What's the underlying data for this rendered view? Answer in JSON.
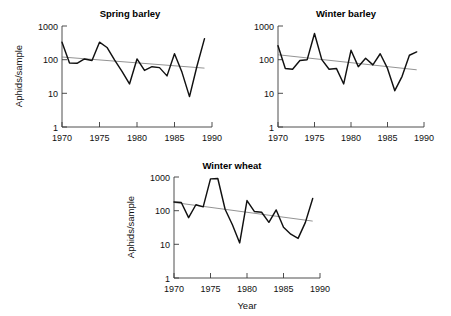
{
  "figure": {
    "background": "#ffffff",
    "series_color": "#111111",
    "trend_color": "#6f6f6f",
    "axis_color": "#3a3a3a",
    "xlabel": "Year",
    "ylabel": "Aphids/sample"
  },
  "chart_data": [
    {
      "type": "line",
      "title": "Spring barley",
      "xlabel": "",
      "ylabel": "Aphids/sample",
      "yscale": "log",
      "ylim": [
        1,
        1000
      ],
      "ytick_labels": [
        "1",
        "10",
        "100",
        "1000"
      ],
      "ytick_values": [
        1,
        10,
        100,
        1000
      ],
      "xlim": [
        1970,
        1990
      ],
      "xtick_labels": [
        "1970",
        "1975",
        "1980",
        "1985",
        "1990"
      ],
      "xtick_values": [
        1970,
        1975,
        1980,
        1985,
        1990
      ],
      "grid": false,
      "legend": "none",
      "x": [
        1970,
        1971,
        1972,
        1973,
        1974,
        1975,
        1976,
        1977,
        1978,
        1979,
        1980,
        1981,
        1982,
        1983,
        1984,
        1985,
        1986,
        1987,
        1988,
        1989
      ],
      "series": [
        {
          "name": "Aphids/sample",
          "values": [
            330,
            80,
            78,
            105,
            95,
            330,
            230,
            98,
            45,
            19,
            105,
            48,
            62,
            58,
            33,
            150,
            42,
            8,
            65,
            420
          ]
        },
        {
          "name": "trend",
          "values": [
            120,
            116,
            111,
            107,
            103,
            99,
            95,
            91,
            88,
            84,
            81,
            78,
            75,
            72,
            69,
            66,
            64,
            61,
            59,
            56
          ]
        }
      ]
    },
    {
      "type": "line",
      "title": "Winter barley",
      "xlabel": "",
      "ylabel": "",
      "yscale": "log",
      "ylim": [
        1,
        1000
      ],
      "ytick_labels": [
        "1",
        "10",
        "100",
        "1000"
      ],
      "ytick_values": [
        1,
        10,
        100,
        1000
      ],
      "xlim": [
        1970,
        1990
      ],
      "xtick_labels": [
        "1970",
        "1975",
        "1980",
        "1985",
        "1990"
      ],
      "xtick_values": [
        1970,
        1975,
        1980,
        1985,
        1990
      ],
      "grid": false,
      "legend": "none",
      "x": [
        1970,
        1971,
        1972,
        1973,
        1974,
        1975,
        1976,
        1977,
        1978,
        1979,
        1980,
        1981,
        1982,
        1983,
        1984,
        1985,
        1986,
        1987,
        1988,
        1989
      ],
      "series": [
        {
          "name": "Aphids/sample",
          "values": [
            260,
            55,
            52,
            95,
            100,
            600,
            100,
            52,
            55,
            19,
            190,
            62,
            110,
            70,
            150,
            55,
            12,
            32,
            135,
            170
          ]
        },
        {
          "name": "trend",
          "values": [
            140,
            132,
            125,
            118,
            112,
            106,
            100,
            95,
            90,
            85,
            81,
            77,
            73,
            69,
            66,
            62,
            59,
            56,
            53,
            50
          ]
        }
      ]
    },
    {
      "type": "line",
      "title": "Winter wheat",
      "xlabel": "Year",
      "ylabel": "Aphids/sample",
      "yscale": "log",
      "ylim": [
        1,
        1000
      ],
      "ytick_labels": [
        "1",
        "10",
        "100",
        "1000"
      ],
      "ytick_values": [
        1,
        10,
        100,
        1000
      ],
      "xlim": [
        1970,
        1990
      ],
      "xtick_labels": [
        "1970",
        "1975",
        "1980",
        "1985",
        "1990"
      ],
      "xtick_values": [
        1970,
        1975,
        1980,
        1985,
        1990
      ],
      "grid": false,
      "legend": "none",
      "x": [
        1970,
        1971,
        1972,
        1973,
        1974,
        1975,
        1976,
        1977,
        1978,
        1979,
        1980,
        1981,
        1982,
        1983,
        1984,
        1985,
        1986,
        1987,
        1988,
        1989
      ],
      "series": [
        {
          "name": "Aphids/sample",
          "values": [
            180,
            175,
            62,
            150,
            130,
            880,
            900,
            110,
            38,
            11,
            200,
            95,
            90,
            45,
            105,
            32,
            20,
            15,
            45,
            230
          ]
        },
        {
          "name": "trend",
          "values": [
            175,
            164,
            153,
            143,
            134,
            125,
            117,
            109,
            102,
            96,
            89,
            84,
            78,
            73,
            68,
            64,
            60,
            56,
            52,
            49
          ]
        }
      ]
    }
  ]
}
